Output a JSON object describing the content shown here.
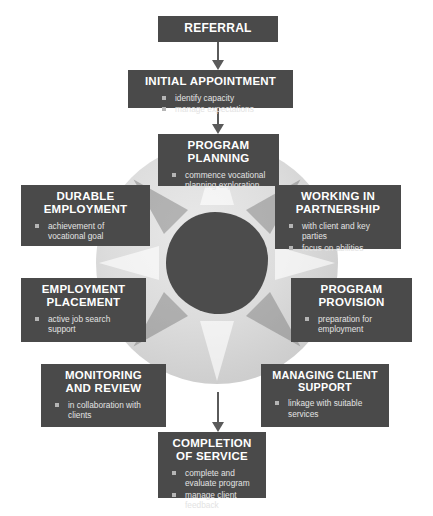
{
  "diagram": {
    "colors": {
      "box_fill": "#4a4a4a",
      "box_text": "#ffffff",
      "bullet_text": "#e3e3e3",
      "bullet_marker": "#b5b5b5",
      "arrow": "#5a5a5a",
      "circle_outer": "#d6d6d6",
      "circle_inner": "#4c4c4c",
      "background": "#ffffff"
    },
    "nodes": [
      {
        "id": "referral",
        "title": "REFERRAL",
        "bullets": []
      },
      {
        "id": "initial-appointment",
        "title": "INITIAL APPOINTMENT",
        "bullets": [
          "identify capacity",
          "manage expectations"
        ]
      },
      {
        "id": "program-planning",
        "title": "PROGRAM\nPLANNING",
        "bullets": [
          "commence vocational planning exploration"
        ]
      },
      {
        "id": "working-in-partnership",
        "title": "WORKING IN\nPARTNERSHIP",
        "bullets": [
          "with client and key parties",
          "focus on abilities"
        ]
      },
      {
        "id": "program-provision",
        "title": "PROGRAM\nPROVISION",
        "bullets": [
          "preparation for employment"
        ]
      },
      {
        "id": "managing-client-support",
        "title": "MANAGING CLIENT\nSUPPORT",
        "bullets": [
          "linkage with suitable services"
        ]
      },
      {
        "id": "completion-of-service",
        "title": "COMPLETION\nOF SERVICE",
        "bullets": [
          "complete and evaluate program",
          "manage client feedback"
        ]
      },
      {
        "id": "monitoring-and-review",
        "title": "MONITORING\nAND REVIEW",
        "bullets": [
          "in collaboration with clients"
        ]
      },
      {
        "id": "employment-placement",
        "title": "EMPLOYMENT\nPLACEMENT",
        "bullets": [
          "active job search support"
        ]
      },
      {
        "id": "durable-employment",
        "title": "DURABLE\nEMPLOYMENT",
        "bullets": [
          "achievement of vocational goal"
        ]
      }
    ],
    "arrows": [
      {
        "id": "referral-to-initial",
        "from": "referral",
        "to": "initial-appointment",
        "direction": "down"
      },
      {
        "id": "initial-to-planning",
        "from": "initial-appointment",
        "to": "program-planning",
        "direction": "down"
      },
      {
        "id": "cycle-to-completion",
        "from": "monitoring-and-review",
        "to": "completion-of-service",
        "direction": "down"
      }
    ]
  }
}
